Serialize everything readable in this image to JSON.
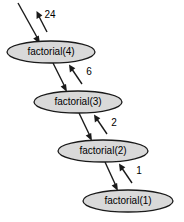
{
  "diagram": {
    "colors": {
      "node_fill": "#d9d9d9",
      "node_stroke": "#1a1a1a",
      "edge_stroke": "#1a1a1a",
      "background": "#ffffff",
      "text": "#000000"
    },
    "nodes": [
      {
        "id": "f4",
        "label": "factorial(4)",
        "cx": 51,
        "cy": 52,
        "rx": 44,
        "ry": 11
      },
      {
        "id": "f3",
        "label": "factorial(3)",
        "cx": 78,
        "cy": 102,
        "rx": 44,
        "ry": 11
      },
      {
        "id": "f2",
        "label": "factorial(2)",
        "cx": 103,
        "cy": 151,
        "rx": 45,
        "ry": 11
      },
      {
        "id": "f1",
        "label": "factorial(1)",
        "cx": 128,
        "cy": 201,
        "rx": 45,
        "ry": 11
      }
    ],
    "call_edges": [
      {
        "id": "call-in-f4",
        "from": "external",
        "to": "f4"
      },
      {
        "id": "call-f4-f3",
        "from": "f4",
        "to": "f3"
      },
      {
        "id": "call-f3-f2",
        "from": "f3",
        "to": "f2"
      },
      {
        "id": "call-f2-f1",
        "from": "f2",
        "to": "f1"
      }
    ],
    "return_edges": [
      {
        "id": "return-f4-out",
        "from": "f4",
        "to": "external",
        "label": "24",
        "label_x": 50,
        "label_y": 15
      },
      {
        "id": "return-f3-f4",
        "from": "f3",
        "to": "f4",
        "label": "6",
        "label_x": 89,
        "label_y": 72
      },
      {
        "id": "return-f2-f3",
        "from": "f2",
        "to": "f3",
        "label": "2",
        "label_x": 114,
        "label_y": 123
      },
      {
        "id": "return-f1-f2",
        "from": "f1",
        "to": "f2",
        "label": "1",
        "label_x": 139,
        "label_y": 171
      }
    ]
  }
}
